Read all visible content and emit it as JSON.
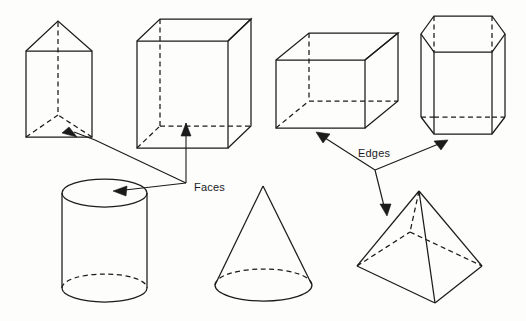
{
  "figure": {
    "background_color": "#fdfdfb",
    "line_color": "#1b1b1b"
  },
  "labels": [
    {
      "id": "faces",
      "text": "Faces",
      "x": 194,
      "y": 187,
      "points_to": [
        "triangular-prism",
        "rectangular-prism",
        "cylinder"
      ]
    },
    {
      "id": "edges",
      "text": "Edges",
      "x": 358,
      "y": 153,
      "points_to": [
        "cube",
        "hexagonal-prism",
        "square-pyramid"
      ]
    }
  ],
  "solids": [
    {
      "id": "triangular-prism",
      "name": "Triangular prism",
      "row": 1,
      "column": 1,
      "faces": 5,
      "edges": 9,
      "vertices": 6
    },
    {
      "id": "rectangular-prism",
      "name": "Rectangular prism",
      "row": 1,
      "column": 2,
      "faces": 6,
      "edges": 12,
      "vertices": 8
    },
    {
      "id": "cube",
      "name": "Cube",
      "row": 1,
      "column": 3,
      "faces": 6,
      "edges": 12,
      "vertices": 8
    },
    {
      "id": "hexagonal-prism",
      "name": "Hexagonal prism",
      "row": 1,
      "column": 4,
      "faces": 8,
      "edges": 18,
      "vertices": 12
    },
    {
      "id": "cylinder",
      "name": "Cylinder",
      "row": 2,
      "column": 1,
      "faces": 3,
      "edges": 2,
      "vertices": 0
    },
    {
      "id": "cone",
      "name": "Cone",
      "row": 2,
      "column": 2,
      "faces": 2,
      "edges": 1,
      "vertices": 1
    },
    {
      "id": "square-pyramid",
      "name": "Square pyramid",
      "row": 2,
      "column": 3,
      "faces": 5,
      "edges": 8,
      "vertices": 5
    }
  ]
}
